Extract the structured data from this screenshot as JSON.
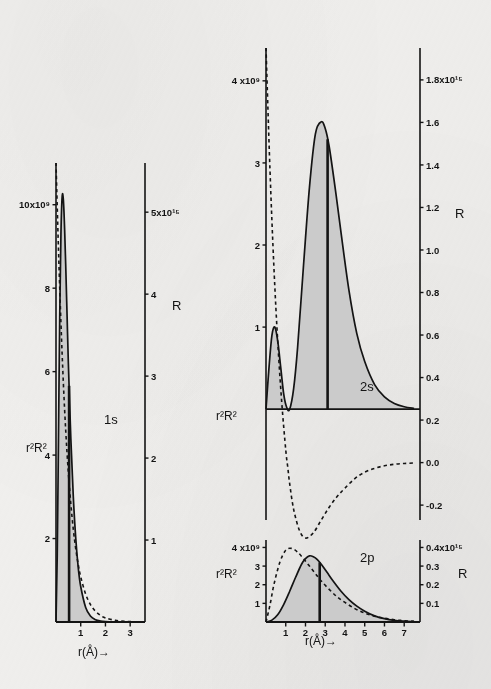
{
  "figure": {
    "background_color": "#f2f1ef",
    "ink_color": "#141414",
    "fill_color": "#c9c9c9",
    "caption_note": ""
  },
  "panels": {
    "one_s": {
      "orbital_label": "1s",
      "left_axis_label": "r²R²",
      "right_axis_label": "R",
      "x_axis_label": "r(Å)→",
      "left_ticks": [
        "10x10⁹",
        "8",
        "6",
        "4",
        "2"
      ],
      "right_ticks": [
        "5x10¹⁵",
        "4",
        "3",
        "2",
        "1"
      ],
      "x_ticks": [
        "1",
        "2",
        "3"
      ]
    },
    "two_s": {
      "orbital_label": "2s",
      "left_axis_label": "r²R²",
      "right_axis_label": "R",
      "left_ticks": [
        "4 x10⁹",
        "3",
        "2",
        "1"
      ],
      "right_ticks": [
        "1.8x10¹⁵",
        "1.6",
        "1.4",
        "1.2",
        "1.0",
        "0.8",
        "0.6",
        "0.4",
        "0.2",
        "0.0",
        "-0.2"
      ]
    },
    "two_p": {
      "orbital_label": "2p",
      "left_axis_label": "r²R²",
      "right_axis_label": "R",
      "x_axis_label": "r(Å)→",
      "left_ticks": [
        "4 x10⁹",
        "3",
        "2",
        "1"
      ],
      "right_ticks": [
        "0.4x10¹⁵",
        "0.3",
        "0.2",
        "0.1"
      ],
      "x_ticks": [
        "1",
        "2",
        "3",
        "4",
        "5",
        "6",
        "7"
      ]
    }
  },
  "chart_data": [
    {
      "type": "line",
      "title": "1s",
      "xlabel": "r(Å)→",
      "ylabel": "r²R²",
      "y2label": "R",
      "xlim": [
        0,
        3.6
      ],
      "ylim": [
        0,
        11
      ],
      "y2lim": [
        0,
        5.6
      ],
      "xticks": [
        1,
        2,
        3
      ],
      "yticks": [
        2,
        4,
        6,
        8,
        10
      ],
      "y2ticks": [
        1,
        2,
        3,
        4,
        5
      ],
      "ytick_labels": [
        "2",
        "4",
        "6",
        "8",
        "10x10⁹"
      ],
      "y2tick_labels": [
        "1",
        "2",
        "3",
        "4",
        "5x10¹⁵"
      ],
      "grid": false,
      "legend": "none",
      "series": [
        {
          "name": "r²R²",
          "style": "solid-filled",
          "axis": "left",
          "x": [
            0.0,
            0.05,
            0.1,
            0.15,
            0.2,
            0.25,
            0.3,
            0.35,
            0.4,
            0.45,
            0.5,
            0.6,
            0.7,
            0.8,
            0.9,
            1.0,
            1.2,
            1.4,
            1.6,
            1.8,
            2.0,
            2.4,
            2.8,
            3.2,
            3.6
          ],
          "y": [
            0.0,
            1.6,
            4.4,
            7.3,
            9.3,
            10.2,
            10.1,
            9.4,
            8.4,
            7.3,
            6.2,
            4.4,
            3.0,
            2.0,
            1.3,
            0.85,
            0.35,
            0.14,
            0.055,
            0.022,
            0.009,
            0.0015,
            0.0003,
            0.0,
            0.0
          ]
        },
        {
          "name": "R",
          "style": "dashed",
          "axis": "right",
          "x": [
            0.0,
            0.1,
            0.2,
            0.3,
            0.4,
            0.5,
            0.6,
            0.7,
            0.8,
            0.9,
            1.0,
            1.2,
            1.4,
            1.6,
            1.8,
            2.0,
            2.4,
            2.8,
            3.2,
            3.6
          ],
          "y": [
            5.6,
            4.55,
            3.65,
            2.9,
            2.3,
            1.82,
            1.44,
            1.13,
            0.89,
            0.7,
            0.55,
            0.34,
            0.21,
            0.13,
            0.08,
            0.05,
            0.02,
            0.007,
            0.003,
            0.001
          ]
        }
      ],
      "annotations": [
        {
          "text": "1s",
          "x": 1.55,
          "y": 8.3
        },
        {
          "text": "mean-radius-marker",
          "type": "vline",
          "x": 0.53
        }
      ]
    },
    {
      "type": "line",
      "title": "2s",
      "xlabel": "",
      "ylabel": "r²R²",
      "y2label": "R",
      "xlim": [
        0,
        7.8
      ],
      "ylim": [
        -1.35,
        4.4
      ],
      "y2lim": [
        -0.27,
        1.95
      ],
      "yticks": [
        1,
        2,
        3,
        4
      ],
      "ytick_labels": [
        "1",
        "2",
        "3",
        "4 x10⁹"
      ],
      "y2ticks": [
        -0.2,
        0.0,
        0.2,
        0.4,
        0.6,
        0.8,
        1.0,
        1.2,
        1.4,
        1.6,
        1.8
      ],
      "y2tick_labels": [
        "-0.2",
        "0.0",
        "0.2",
        "0.4",
        "0.6",
        "0.8",
        "1.0",
        "1.2",
        "1.4",
        "1.6",
        "1.8x10¹⁵"
      ],
      "grid": false,
      "legend": "none",
      "series": [
        {
          "name": "r²R²",
          "style": "solid-filled",
          "axis": "left",
          "x": [
            0.0,
            0.15,
            0.3,
            0.45,
            0.6,
            0.75,
            0.9,
            1.05,
            1.2,
            1.4,
            1.6,
            1.9,
            2.2,
            2.5,
            2.8,
            3.0,
            3.2,
            3.5,
            3.8,
            4.2,
            4.6,
            5.0,
            5.5,
            6.0,
            6.5,
            7.0,
            7.5
          ],
          "y": [
            0.0,
            0.5,
            0.9,
            1.0,
            0.82,
            0.5,
            0.18,
            0.02,
            0.0,
            0.25,
            0.75,
            1.75,
            2.7,
            3.35,
            3.5,
            3.42,
            3.2,
            2.7,
            2.15,
            1.45,
            0.92,
            0.58,
            0.3,
            0.15,
            0.07,
            0.03,
            0.01
          ]
        },
        {
          "name": "R",
          "style": "dashed",
          "axis": "right",
          "x": [
            0.0,
            0.2,
            0.4,
            0.6,
            0.8,
            1.0,
            1.1,
            1.2,
            1.4,
            1.7,
            2.0,
            2.4,
            2.8,
            3.2,
            3.6,
            4.0,
            4.5,
            5.0,
            5.5,
            6.0,
            6.5,
            7.0,
            7.5
          ],
          "y": [
            1.95,
            1.38,
            0.92,
            0.56,
            0.28,
            0.06,
            -0.02,
            -0.1,
            -0.22,
            -0.32,
            -0.355,
            -0.33,
            -0.27,
            -0.21,
            -0.16,
            -0.12,
            -0.075,
            -0.045,
            -0.027,
            -0.015,
            -0.008,
            -0.004,
            -0.002
          ]
        }
      ],
      "annotations": [
        {
          "text": "2s",
          "x": 4.3,
          "y": 3.45
        },
        {
          "text": "mean-radius-marker",
          "type": "vline",
          "x": 3.12
        }
      ]
    },
    {
      "type": "line",
      "title": "2p",
      "xlabel": "r(Å)→",
      "ylabel": "r²R²",
      "y2label": "R",
      "xlim": [
        0,
        7.8
      ],
      "ylim": [
        0,
        4.4
      ],
      "y2lim": [
        0,
        0.44
      ],
      "xticks": [
        1,
        2,
        3,
        4,
        5,
        6,
        7
      ],
      "yticks": [
        1,
        2,
        3,
        4
      ],
      "ytick_labels": [
        "1",
        "2",
        "3",
        "4 x10⁹"
      ],
      "y2ticks": [
        0.1,
        0.2,
        0.3,
        0.4
      ],
      "y2tick_labels": [
        "0.1",
        "0.2",
        "0.3",
        "0.4x10¹⁵"
      ],
      "grid": false,
      "legend": "none",
      "series": [
        {
          "name": "r²R²",
          "style": "solid-filled",
          "axis": "left",
          "x": [
            0.0,
            0.3,
            0.6,
            0.9,
            1.2,
            1.5,
            1.8,
            2.0,
            2.2,
            2.4,
            2.6,
            2.8,
            3.1,
            3.4,
            3.8,
            4.2,
            4.6,
            5.0,
            5.5,
            6.0,
            6.5,
            7.0,
            7.5
          ],
          "y": [
            0.0,
            0.1,
            0.4,
            0.95,
            1.65,
            2.4,
            3.1,
            3.4,
            3.55,
            3.5,
            3.35,
            3.1,
            2.65,
            2.2,
            1.65,
            1.2,
            0.85,
            0.58,
            0.33,
            0.18,
            0.09,
            0.045,
            0.02
          ]
        },
        {
          "name": "R",
          "style": "dashed",
          "axis": "right",
          "x": [
            0.0,
            0.2,
            0.4,
            0.7,
            1.0,
            1.3,
            1.6,
            1.9,
            2.2,
            2.5,
            2.8,
            3.2,
            3.6,
            4.0,
            4.5,
            5.0,
            5.5,
            6.0,
            6.5,
            7.0,
            7.5
          ],
          "y": [
            0.0,
            0.09,
            0.2,
            0.32,
            0.385,
            0.395,
            0.375,
            0.34,
            0.3,
            0.26,
            0.22,
            0.175,
            0.135,
            0.105,
            0.072,
            0.048,
            0.031,
            0.02,
            0.012,
            0.007,
            0.004
          ]
        }
      ],
      "annotations": [
        {
          "text": "2p",
          "x": 4.3,
          "y": 3.3
        },
        {
          "text": "mean-radius-marker",
          "type": "vline",
          "x": 2.72
        }
      ]
    }
  ]
}
